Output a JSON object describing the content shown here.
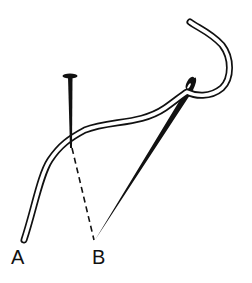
{
  "diagram": {
    "type": "needlework-stitch-illustration",
    "labels": {
      "a": "A",
      "b": "B"
    },
    "elements": {
      "thread": "white outlined thread from A over the pin to the needle eye, looping upward",
      "pin": "black pin inserted vertically at the thread bend",
      "needle": "black needle from point B up to the eye at upper right",
      "guide": "dashed line from pin base to B"
    },
    "colors": {
      "ink": "#111111",
      "background": "#ffffff",
      "thread_fill": "#ffffff"
    }
  }
}
